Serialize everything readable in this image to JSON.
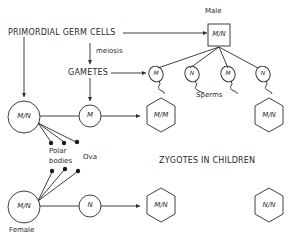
{
  "diagram": {
    "labels": {
      "primordial": "PRIMORDIAL GERM CELLS",
      "meiosis": "meiosis",
      "gametes": "GAMETES",
      "male": "Male",
      "female": "Female",
      "sperms": "Sperms",
      "polar_bodies_1": "Polar",
      "polar_bodies_2": "bodies",
      "ova": "Ova",
      "zygotes": "ZYGOTES IN CHILDREN"
    },
    "male_cell": {
      "genotype": "M/N",
      "shape": "square"
    },
    "female_cell_top": {
      "genotype": "M/N",
      "shape": "circle"
    },
    "female_cell_bottom": {
      "genotype": "M/N",
      "shape": "circle"
    },
    "ova": [
      {
        "allele": "M"
      },
      {
        "allele": "N"
      }
    ],
    "sperms": [
      {
        "allele": "M"
      },
      {
        "allele": "N"
      },
      {
        "allele": "M"
      },
      {
        "allele": "N"
      }
    ],
    "zygotes": [
      {
        "genotype": "M/M"
      },
      {
        "genotype": "M/N"
      },
      {
        "genotype": "M/N"
      },
      {
        "genotype": "N/N"
      }
    ],
    "colors": {
      "line": "#2a2a2a",
      "background": "#ffffff"
    }
  }
}
